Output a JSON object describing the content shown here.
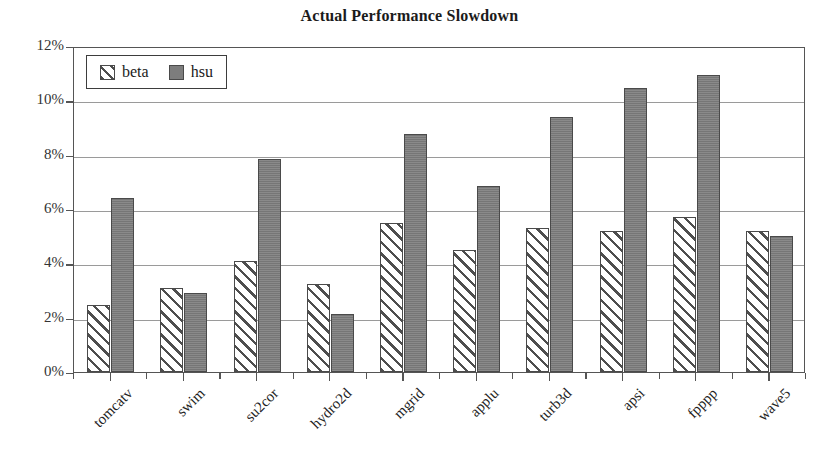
{
  "chart_data": {
    "type": "bar",
    "title": "Actual Performance Slowdown",
    "xlabel": "",
    "ylabel": "",
    "ylim": [
      0,
      12
    ],
    "ytick_labels": [
      "0%",
      "2%",
      "4%",
      "6%",
      "8%",
      "10%",
      "12%"
    ],
    "ytick_values": [
      0,
      2,
      4,
      6,
      8,
      10,
      12
    ],
    "grid": true,
    "legend_position": "top-left",
    "unit": "%",
    "categories": [
      "tomcatv",
      "swim",
      "su2cor",
      "hydro2d",
      "mgrid",
      "applu",
      "turb3d",
      "apsi",
      "fpppp",
      "wave5"
    ],
    "series": [
      {
        "name": "beta",
        "fill": "white-diagonal-hatch",
        "color": "#ffffff",
        "values": [
          2.45,
          3.1,
          4.1,
          3.25,
          5.5,
          4.5,
          5.3,
          5.2,
          5.7,
          5.2
        ]
      },
      {
        "name": "hsu",
        "fill": "solid-gray",
        "color": "#7d7d7d",
        "values": [
          6.4,
          2.9,
          7.85,
          2.15,
          8.75,
          6.85,
          9.4,
          10.45,
          10.95,
          5.0
        ]
      }
    ]
  },
  "legend": {
    "items": [
      {
        "label": "beta",
        "swatch": "hatched-swatch"
      },
      {
        "label": "hsu",
        "swatch": "solid-gray-swatch"
      }
    ]
  }
}
